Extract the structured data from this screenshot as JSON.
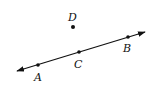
{
  "diagram": {
    "type": "geometry-line-with-points",
    "line": {
      "start": [
        17,
        71
      ],
      "end": [
        145,
        32
      ],
      "arrows": "both",
      "color": "#111111"
    },
    "points": [
      {
        "id": "A",
        "label": "A",
        "x": 38,
        "y": 65,
        "label_x": 34,
        "label_y": 81,
        "on_line": true
      },
      {
        "id": "C",
        "label": "C",
        "x": 79,
        "y": 52,
        "label_x": 74,
        "label_y": 68,
        "on_line": true
      },
      {
        "id": "B",
        "label": "B",
        "x": 128,
        "y": 37,
        "label_x": 123,
        "label_y": 52,
        "on_line": true
      },
      {
        "id": "D",
        "label": "D",
        "x": 73,
        "y": 27,
        "label_x": 68,
        "label_y": 21,
        "on_line": false
      }
    ]
  }
}
